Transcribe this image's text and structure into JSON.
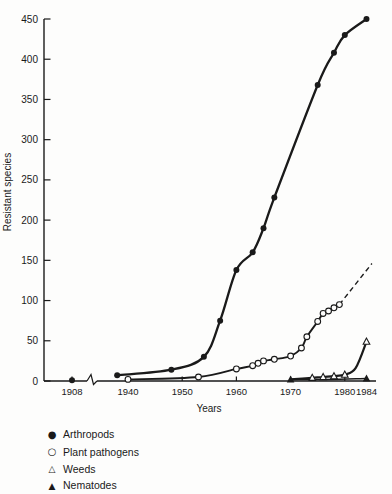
{
  "figure": {
    "background": "#fdfdfc",
    "ink_color": "#1a1a1a"
  },
  "chart_data": {
    "type": "line",
    "title": "",
    "xlabel": "Years",
    "ylabel": "Resistant species",
    "ylim": [
      0,
      450
    ],
    "yticks": [
      0,
      50,
      100,
      150,
      200,
      250,
      300,
      350,
      400,
      450
    ],
    "xticks": [
      1908,
      1940,
      1950,
      1960,
      1970,
      1980,
      1984
    ],
    "x_axis_break_between": [
      1908,
      1938
    ],
    "grid": false,
    "legend_position": "below-left",
    "series": [
      {
        "name": "Arthropods",
        "marker": "filled-circle",
        "line": "solid",
        "points": [
          [
            1908,
            1
          ],
          [
            1938,
            7
          ],
          [
            1948,
            14
          ],
          [
            1954,
            30
          ],
          [
            1957,
            75
          ],
          [
            1960,
            138
          ],
          [
            1963,
            160
          ],
          [
            1965,
            190
          ],
          [
            1967,
            228
          ],
          [
            1975,
            368
          ],
          [
            1978,
            408
          ],
          [
            1980,
            430
          ],
          [
            1984,
            450
          ]
        ],
        "curve_points": [
          [
            1938,
            7
          ],
          [
            1948,
            14
          ],
          [
            1954,
            30
          ],
          [
            1957,
            75
          ],
          [
            1960,
            138
          ],
          [
            1963,
            160
          ],
          [
            1965,
            190
          ],
          [
            1967,
            228
          ],
          [
            1975,
            368
          ],
          [
            1978,
            408
          ],
          [
            1980,
            430
          ],
          [
            1984,
            450
          ]
        ]
      },
      {
        "name": "Plant pathogens",
        "marker": "open-circle",
        "line": "solid",
        "points": [
          [
            1940,
            2
          ],
          [
            1953,
            5
          ],
          [
            1960,
            15
          ],
          [
            1963,
            19
          ],
          [
            1964,
            22
          ],
          [
            1965,
            25
          ],
          [
            1967,
            27
          ],
          [
            1970,
            31
          ],
          [
            1972,
            41
          ],
          [
            1973,
            55
          ],
          [
            1975,
            74
          ],
          [
            1976,
            84
          ],
          [
            1977,
            87
          ],
          [
            1978,
            91
          ],
          [
            1979,
            95
          ]
        ],
        "curve_points": [
          [
            1940,
            2
          ],
          [
            1953,
            5
          ],
          [
            1960,
            15
          ],
          [
            1963,
            19
          ],
          [
            1964,
            22
          ],
          [
            1965,
            25
          ],
          [
            1967,
            27
          ],
          [
            1970,
            31
          ],
          [
            1972,
            41
          ],
          [
            1973,
            55
          ],
          [
            1975,
            74
          ],
          [
            1976,
            84
          ],
          [
            1977,
            87
          ],
          [
            1978,
            91
          ],
          [
            1979,
            95
          ]
        ],
        "dashed_projection": [
          [
            1979,
            95
          ],
          [
            1985,
            146
          ]
        ]
      },
      {
        "name": "Weeds",
        "marker": "open-triangle",
        "line": "solid",
        "points": [
          [
            1974,
            4
          ],
          [
            1976,
            5
          ],
          [
            1978,
            6
          ],
          [
            1980,
            8
          ],
          [
            1984,
            49
          ]
        ],
        "curve_points": [
          [
            1970,
            2
          ],
          [
            1974,
            4
          ],
          [
            1976,
            5
          ],
          [
            1978,
            6
          ],
          [
            1980,
            8
          ],
          [
            1982,
            16
          ],
          [
            1984,
            49
          ]
        ]
      },
      {
        "name": "Nematodes",
        "marker": "filled-triangle",
        "line": "solid",
        "points": [
          [
            1970,
            2
          ],
          [
            1984,
            3
          ]
        ],
        "curve_points": [
          [
            1970,
            2
          ],
          [
            1977,
            2
          ],
          [
            1984,
            3
          ]
        ]
      }
    ],
    "legend": {
      "items": [
        {
          "icon": "filled-circle-icon",
          "symbol": "●",
          "label": "Arthropods"
        },
        {
          "icon": "open-circle-icon",
          "symbol": "○",
          "label": "Plant pathogens"
        },
        {
          "icon": "open-triangle-icon",
          "symbol": "△",
          "label": "Weeds"
        },
        {
          "icon": "filled-triangle-icon",
          "symbol": "▲",
          "label": "Nematodes"
        }
      ]
    }
  }
}
